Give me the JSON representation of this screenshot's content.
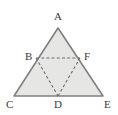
{
  "figure": {
    "name": "triangle-midpoint-diagram",
    "background_color": "#ffffff",
    "fill_color": "#e6e6e4",
    "stroke_color": "#808080",
    "dashed_stroke_color": "#6e6e6e",
    "label_color": "#3b3b3b"
  },
  "labels": {
    "apex": "A",
    "left_midpoint": "B",
    "bottom_left": "C",
    "base_midpoint": "D",
    "bottom_right": "E",
    "right_midpoint": "F"
  },
  "points": {
    "A": {
      "x": 58,
      "y": 28
    },
    "B": {
      "x": 36,
      "y": 58
    },
    "C": {
      "x": 14,
      "y": 96
    },
    "D": {
      "x": 58,
      "y": 96
    },
    "E": {
      "x": 103,
      "y": 96
    },
    "F": {
      "x": 80,
      "y": 58
    }
  },
  "label_positions": {
    "A": {
      "x": 54,
      "y": 11
    },
    "B": {
      "x": 25,
      "y": 51
    },
    "C": {
      "x": 6,
      "y": 99
    },
    "D": {
      "x": 54,
      "y": 99
    },
    "E": {
      "x": 104,
      "y": 99
    },
    "F": {
      "x": 84,
      "y": 51
    }
  },
  "segments": {
    "outer_triangle": "A-C-E",
    "dashed_inner_triangle": "B-D-F"
  }
}
